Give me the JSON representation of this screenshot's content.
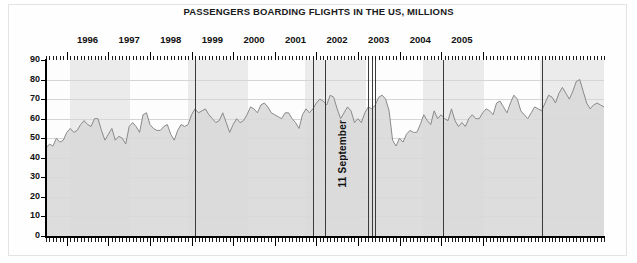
{
  "chart_data": {
    "type": "area",
    "title": "PASSENGERS BOARDING FLIGHTS IN THE US, MILLIONS",
    "xlabel": "",
    "ylabel": "",
    "ylim": [
      0,
      90
    ],
    "yticks": [
      0,
      10,
      20,
      30,
      40,
      50,
      60,
      70,
      80,
      90
    ],
    "grid": true,
    "legend": "none",
    "x_tick_labels": [
      "1996",
      "1997",
      "1998",
      "1999",
      "2000",
      "2001",
      "2002",
      "2003",
      "2004",
      "2005"
    ],
    "x_minor_ticks": "monthly",
    "series_name": "Passengers boarding flights in the US",
    "series_color": "#8c8c8c",
    "fill_color": "#d9d9d9",
    "x_start": "1995-07",
    "x_end": "2005-12",
    "x_step": "month",
    "values": [
      45,
      47,
      46,
      50,
      48,
      49,
      53,
      55,
      53,
      54,
      57,
      59,
      57,
      56,
      60,
      60,
      54,
      49,
      52,
      55,
      49,
      51,
      50,
      47,
      56,
      58,
      56,
      53,
      62,
      63,
      57,
      55,
      54,
      54,
      56,
      57,
      52,
      49,
      54,
      57,
      56,
      57,
      62,
      65,
      63,
      64,
      65,
      62,
      60,
      58,
      59,
      63,
      58,
      53,
      57,
      60,
      58,
      59,
      62,
      66,
      65,
      63,
      67,
      68,
      66,
      63,
      62,
      61,
      60,
      63,
      63,
      60,
      58,
      55,
      62,
      65,
      63,
      65,
      68,
      70,
      69,
      67,
      72,
      71,
      65,
      60,
      63,
      66,
      64,
      58,
      60,
      58,
      63,
      66,
      65,
      67,
      71,
      72,
      70,
      64,
      49,
      46,
      50,
      48,
      52,
      54,
      53,
      53,
      57,
      62,
      59,
      57,
      64,
      60,
      62,
      60,
      59,
      65,
      59,
      56,
      58,
      56,
      60,
      62,
      60,
      60,
      63,
      65,
      64,
      62,
      68,
      69,
      66,
      63,
      68,
      72,
      70,
      64,
      62,
      60,
      63,
      66,
      65,
      64,
      68,
      72,
      71,
      68,
      73,
      76,
      73,
      70,
      74,
      79,
      80,
      74,
      68,
      65,
      67,
      68,
      67,
      66
    ],
    "annotations": [
      {
        "text": "11 September",
        "x": "2001-09",
        "orientation": "vertical"
      }
    ],
    "vertical_markers": [
      {
        "x_px": 195
      },
      {
        "x_px": 313
      },
      {
        "x_px": 325
      },
      {
        "x_px": 368
      },
      {
        "x_px": 372
      },
      {
        "x_px": 375
      },
      {
        "x_px": 443
      },
      {
        "x_px": 542
      }
    ],
    "shaded_bands": [
      {
        "start_px": 70,
        "end_px": 130
      },
      {
        "start_px": 188,
        "end_px": 248
      },
      {
        "start_px": 305,
        "end_px": 366
      },
      {
        "start_px": 423,
        "end_px": 484
      },
      {
        "start_px": 540,
        "end_px": 604
      }
    ]
  }
}
